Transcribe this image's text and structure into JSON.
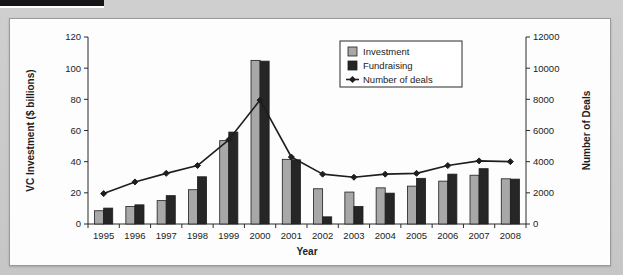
{
  "figure": {
    "background_color": "#c9c9c9",
    "panel_color": "#fdfdfd",
    "border_color": "#9a9a9a"
  },
  "chart_data": {
    "type": "bar",
    "title": "",
    "subtitle": "",
    "xlabel": "Year",
    "ylabel": "VC Investment ($ billions)",
    "y2label": "Number of Deals",
    "categories": [
      "1995",
      "1996",
      "1997",
      "1998",
      "1999",
      "2000",
      "2001",
      "2002",
      "2003",
      "2004",
      "2005",
      "2006",
      "2007",
      "2008"
    ],
    "ylim": [
      0,
      120
    ],
    "y2lim": [
      0,
      12000
    ],
    "yticks": [
      0,
      20,
      40,
      60,
      80,
      100,
      120
    ],
    "y2ticks": [
      0,
      2000,
      4000,
      6000,
      8000,
      10000,
      12000
    ],
    "grid": false,
    "legend_position": "top-right",
    "series": [
      {
        "name": "Investment",
        "kind": "bar",
        "axis": "left",
        "color": "#a8a8a8",
        "edge_color": "#1e1e1e",
        "values": [
          8.5,
          11.2,
          15.0,
          22.0,
          53.5,
          105.0,
          41.5,
          22.6,
          20.5,
          23.2,
          24.3,
          27.5,
          31.3,
          29.0
        ]
      },
      {
        "name": "Fundraising",
        "kind": "bar",
        "axis": "left",
        "color": "#262626",
        "edge_color": "#1e1e1e",
        "values": [
          10.2,
          12.3,
          18.2,
          30.3,
          59.0,
          104.5,
          41.2,
          4.6,
          11.3,
          19.8,
          29.3,
          32.0,
          35.5,
          28.8
        ]
      },
      {
        "name": "Number of deals",
        "kind": "line",
        "axis": "right",
        "color": "#1e1e1e",
        "marker": "diamond",
        "values": [
          1950,
          2700,
          3250,
          3750,
          5400,
          7950,
          4300,
          3200,
          3000,
          3200,
          3250,
          3750,
          4050,
          4000
        ]
      }
    ]
  },
  "legend": {
    "entries": [
      {
        "label": "Investment",
        "swatch": "#a8a8a8",
        "type": "box"
      },
      {
        "label": "Fundraising",
        "swatch": "#262626",
        "type": "box"
      },
      {
        "label": "Number of deals",
        "swatch": "#1e1e1e",
        "type": "line-marker"
      }
    ]
  },
  "axes": {
    "left": {
      "title": "VC Investment ($ billions)",
      "ticks": [
        "0",
        "20",
        "40",
        "60",
        "80",
        "100",
        "120"
      ]
    },
    "right": {
      "title": "Number of Deals",
      "ticks": [
        "0",
        "2000",
        "4000",
        "6000",
        "8000",
        "10000",
        "12000"
      ]
    },
    "bottom": {
      "title": "Year",
      "ticks": [
        "1995",
        "1996",
        "1997",
        "1998",
        "1999",
        "2000",
        "2001",
        "2002",
        "2003",
        "2004",
        "2005",
        "2006",
        "2007",
        "2008"
      ]
    }
  }
}
